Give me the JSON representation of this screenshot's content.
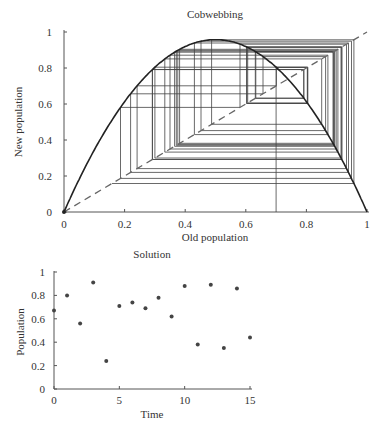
{
  "chart_data": [
    {
      "type": "line",
      "title": "Cobwebbing",
      "xlabel": "Old population",
      "ylabel": "New population",
      "xlim": [
        0,
        1
      ],
      "ylim": [
        0,
        1
      ],
      "xticks": [
        "0",
        "0.2",
        "0.4",
        "0.6",
        "0.8",
        "1"
      ],
      "yticks": [
        "0",
        "0.2",
        "0.4",
        "0.6",
        "0.8",
        "1"
      ],
      "grid": false,
      "series": [
        {
          "name": "logistic map",
          "style": "solid",
          "r": 3.83,
          "function": "r*x*(1-x)"
        },
        {
          "name": "y = x",
          "style": "dashed",
          "x": [
            0,
            1
          ],
          "y": [
            0,
            1
          ]
        },
        {
          "name": "cobweb",
          "style": "thin",
          "start": 0.7,
          "iterates": [
            0.7,
            0.8,
            0.61,
            0.91,
            0.31,
            0.82,
            0.57,
            0.94,
            0.22,
            0.66,
            0.86,
            0.46,
            0.95,
            0.18,
            0.57,
            0.94,
            0.22,
            0.66,
            0.86,
            0.46,
            0.95,
            0.18,
            0.57,
            0.93,
            0.25,
            0.72,
            0.77,
            0.68,
            0.83,
            0.54,
            0.95,
            0.18,
            0.57,
            0.94,
            0.22,
            0.66,
            0.86,
            0.46,
            0.95,
            0.18,
            0.57,
            0.94,
            0.73,
            0.75,
            0.72,
            0.77,
            0.74,
            0.74
          ]
        }
      ]
    },
    {
      "type": "scatter",
      "title": "Solution",
      "xlabel": "Time",
      "ylabel": "Population",
      "xlim": [
        0,
        15
      ],
      "ylim": [
        0,
        1
      ],
      "xticks": [
        "0",
        "5",
        "10",
        "15"
      ],
      "yticks": [
        "0",
        "0.2",
        "0.4",
        "0.6",
        "0.8",
        "1"
      ],
      "grid": false,
      "x": [
        0,
        1,
        2,
        3,
        4,
        5,
        6,
        7,
        8,
        9,
        10,
        11,
        12,
        13,
        14,
        15
      ],
      "y": [
        0.67,
        0.8,
        0.56,
        0.91,
        0.24,
        0.71,
        0.74,
        0.69,
        0.78,
        0.62,
        0.88,
        0.38,
        0.89,
        0.35,
        0.86,
        0.44
      ]
    }
  ]
}
